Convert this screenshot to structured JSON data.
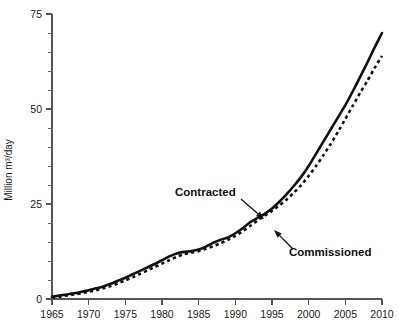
{
  "chart_data": {
    "type": "line",
    "title": "",
    "xlabel": "",
    "ylabel": "Million m³/day",
    "xlim": [
      1965,
      2010
    ],
    "ylim": [
      0,
      75
    ],
    "grid": false,
    "legend_position": "inline-annotations",
    "x_ticks": [
      1965,
      1970,
      1975,
      1980,
      1985,
      1990,
      1995,
      2000,
      2005,
      2010
    ],
    "x_tick_labels": [
      "1965",
      "1970",
      "1975",
      "1980",
      "1985",
      "1990",
      "1995",
      "2000",
      "2005",
      "2010"
    ],
    "y_ticks": [
      0,
      25,
      50,
      75
    ],
    "y_tick_labels": [
      "0",
      "25",
      "50",
      "75"
    ],
    "y_minor_tick_interval": 5,
    "x": [
      1965,
      1966,
      1967,
      1968,
      1969,
      1970,
      1971,
      1972,
      1973,
      1974,
      1975,
      1976,
      1977,
      1978,
      1979,
      1980,
      1981,
      1982,
      1983,
      1984,
      1985,
      1986,
      1987,
      1988,
      1989,
      1990,
      1991,
      1992,
      1993,
      1994,
      1995,
      1996,
      1997,
      1998,
      1999,
      2000,
      2001,
      2002,
      2003,
      2004,
      2005,
      2006,
      2007,
      2008,
      2009,
      2010
    ],
    "series": [
      {
        "name": "Contracted",
        "style": "solid",
        "color": "#111111",
        "values": [
          0.6,
          0.9,
          1.2,
          1.5,
          1.9,
          2.3,
          2.8,
          3.3,
          4.0,
          4.8,
          5.6,
          6.5,
          7.4,
          8.3,
          9.2,
          10.2,
          11.2,
          12.0,
          12.4,
          12.6,
          13.0,
          13.8,
          14.8,
          15.6,
          16.2,
          17.3,
          18.6,
          20.2,
          21.3,
          22.4,
          23.8,
          25.6,
          27.6,
          29.8,
          32.2,
          35.0,
          38.2,
          41.4,
          44.6,
          47.8,
          51.0,
          54.6,
          58.4,
          62.2,
          66.2,
          70.0
        ]
      },
      {
        "name": "Commissioned",
        "style": "dashed",
        "color": "#111111",
        "values": [
          0.4,
          0.6,
          0.9,
          1.2,
          1.5,
          1.9,
          2.3,
          2.8,
          3.4,
          4.1,
          4.9,
          5.7,
          6.6,
          7.5,
          8.4,
          9.3,
          10.2,
          11.1,
          11.8,
          12.2,
          12.6,
          13.2,
          13.9,
          14.7,
          15.6,
          16.6,
          17.8,
          19.2,
          20.6,
          21.9,
          23.2,
          24.6,
          26.2,
          28.0,
          30.0,
          32.4,
          35.0,
          37.8,
          40.8,
          44.0,
          47.4,
          50.8,
          54.2,
          57.4,
          60.8,
          64.0
        ]
      }
    ],
    "annotations": [
      {
        "label": "Contracted",
        "text_x": 175,
        "text_y": 196,
        "arrow_from_x": 241,
        "arrow_from_y": 199,
        "arrow_to_x": 264,
        "arrow_to_y": 219
      },
      {
        "label": "Commissioned",
        "text_x": 289,
        "text_y": 256,
        "arrow_from_x": 293,
        "arrow_from_y": 249,
        "arrow_to_x": 274,
        "arrow_to_y": 230
      }
    ]
  }
}
